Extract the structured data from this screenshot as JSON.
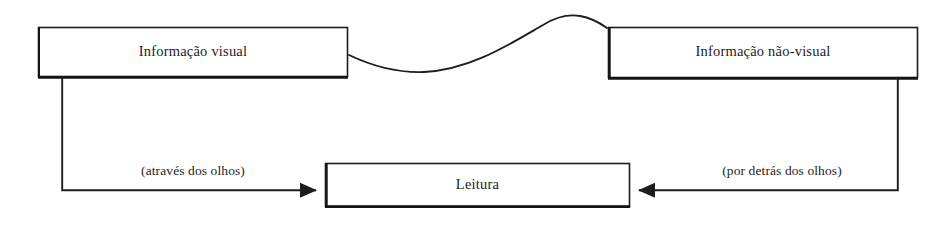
{
  "diagram": {
    "background_color": "#ffffff",
    "line_color": "#1d1d1d",
    "text_color": "#1d1d1d",
    "nodes": [
      {
        "id": "informacao-visual",
        "label": "Informação visual",
        "x": 38,
        "y": 27,
        "width": 310,
        "height": 50
      },
      {
        "id": "informacao-nao-visual",
        "label": "Informação não-visual",
        "x": 608,
        "y": 27,
        "width": 310,
        "height": 51
      },
      {
        "id": "leitura",
        "label": "Leitura",
        "x": 325,
        "y": 163,
        "width": 305,
        "height": 44
      }
    ],
    "edges": [
      {
        "id": "edge-visual-to-leitura",
        "from": "informacao-visual",
        "to": "leitura",
        "label": "(através dos olhos)",
        "arrowhead": "to",
        "style": "orthogonal"
      },
      {
        "id": "edge-nao-visual-to-leitura",
        "from": "informacao-nao-visual",
        "to": "leitura",
        "label": "(por detrás dos olhos)",
        "arrowhead": "to",
        "style": "orthogonal"
      },
      {
        "id": "edge-visual-wave-nao-visual",
        "from": "informacao-visual",
        "to": "informacao-nao-visual",
        "label": "",
        "arrowhead": "none",
        "style": "wavy"
      }
    ]
  }
}
